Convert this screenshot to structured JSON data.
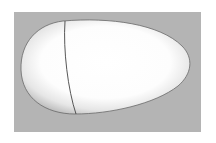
{
  "scene": {
    "subject": "egg-shaped 3D surface",
    "colors": {
      "page_background": "#ffffff",
      "panel_background": "#b4b4b4",
      "shape_highlight": "#ffffff",
      "shape_shadow": "#9a9a9a",
      "outline": "#555555",
      "seam_line": "#444444"
    }
  }
}
